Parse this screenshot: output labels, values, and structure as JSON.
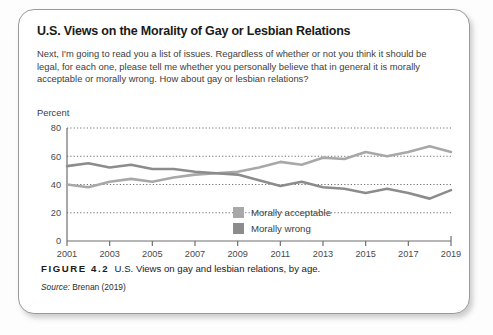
{
  "card": {
    "title": "U.S. Views on the Morality of Gay or Lesbian Relations",
    "question": "Next, I'm going to read you a list of issues. Regardless of whether or not you think it should be legal, for each one, please tell me whether you personally believe that in general it is morally acceptable or morally wrong. How about gay or lesbian relations?",
    "percent_label": "Percent"
  },
  "caption": {
    "figure_number": "FIGURE 4.2",
    "caption_text": "U.S. Views on gay and lesbian relations, by age.",
    "source_label": "Source:",
    "source_value": "Brenan (2019)"
  },
  "colors": {
    "acceptable": "#a8a8a8",
    "wrong": "#8c8c8c",
    "axis": "#6e6e6e",
    "grid": "#6e6e6e",
    "text": "#3d3d3d",
    "card_border": "#9a9a9a"
  },
  "chart_data": {
    "type": "line",
    "title": "U.S. Views on the Morality of Gay or Lesbian Relations",
    "xlabel": "",
    "ylabel": "Percent",
    "ylim": [
      0,
      80
    ],
    "ytick_values": [
      0,
      20,
      40,
      60,
      80
    ],
    "ytick_labels": [
      "0",
      "20",
      "40",
      "60",
      "80"
    ],
    "xlim": [
      2001,
      2019
    ],
    "xtick_values": [
      2001,
      2003,
      2005,
      2007,
      2009,
      2011,
      2013,
      2015,
      2017,
      2019
    ],
    "xtick_labels": [
      "2001",
      "2003",
      "2005",
      "2007",
      "2009",
      "2011",
      "2013",
      "2015",
      "2017",
      "2019"
    ],
    "grid": "horizontal-dotted",
    "legend_position": "inside-center-lower",
    "x": [
      2001,
      2002,
      2003,
      2004,
      2005,
      2006,
      2007,
      2008,
      2009,
      2010,
      2011,
      2012,
      2013,
      2014,
      2015,
      2016,
      2017,
      2018,
      2019
    ],
    "series": [
      {
        "name": "Morally acceptable",
        "color": "#a8a8a8",
        "values": [
          40,
          38,
          42,
          44,
          42,
          45,
          47,
          48,
          49,
          52,
          56,
          54,
          59,
          58,
          63,
          60,
          63,
          67,
          63
        ]
      },
      {
        "name": "Morally wrong",
        "color": "#8c8c8c",
        "values": [
          53,
          55,
          52,
          54,
          51,
          51,
          49,
          48,
          47,
          43,
          39,
          42,
          38,
          37,
          34,
          37,
          34,
          30,
          36
        ]
      }
    ],
    "legend": [
      {
        "label": "Morally acceptable",
        "color": "#a8a8a8"
      },
      {
        "label": "Morally wrong",
        "color": "#8c8c8c"
      }
    ]
  }
}
